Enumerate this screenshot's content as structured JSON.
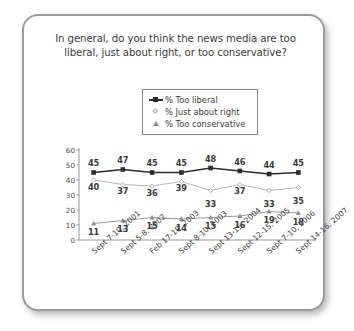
{
  "chart_data": {
    "type": "line",
    "title": "In general, do you think the news media are too liberal, just about right, or too conservative?",
    "xlabel": "",
    "ylabel": "",
    "ylim": [
      0,
      60
    ],
    "yticks": [
      0,
      10,
      20,
      30,
      40,
      50,
      60
    ],
    "grid": false,
    "legend_position": "top-center",
    "categories": [
      "Sept 7-10, 2001",
      "Sept 5-8, 2002",
      "Feb 17-19, 2003",
      "Sept 8-10, 2003",
      "Sept 13-15, 2004",
      "Sept 12-15, 2005",
      "Sept 7-10, 2006",
      "Sept 14-16, 2007"
    ],
    "series": [
      {
        "name": "% Too liberal",
        "marker": "square",
        "color": "#2b2b2b",
        "values": [
          45,
          47,
          45,
          45,
          48,
          46,
          44,
          45
        ]
      },
      {
        "name": "% Just about right",
        "marker": "diamond",
        "color": "#b0b0b0",
        "values": [
          40,
          37,
          36,
          39,
          33,
          37,
          33,
          35
        ]
      },
      {
        "name": "% Too conservative",
        "marker": "triangle",
        "color": "#8e8e8e",
        "values": [
          11,
          13,
          15,
          14,
          15,
          16,
          19,
          18
        ]
      }
    ]
  },
  "legend": {
    "items": [
      {
        "label": "% Too liberal"
      },
      {
        "label": "% Just about right"
      },
      {
        "label": "% Too conservative"
      }
    ]
  },
  "colors": {
    "frame": "#9b9b9b",
    "text": "#3b3b3b",
    "axis": "#8d8d8d",
    "series_dark": "#2b2b2b",
    "series_light": "#b0b0b0",
    "series_mid": "#8e8e8e"
  }
}
